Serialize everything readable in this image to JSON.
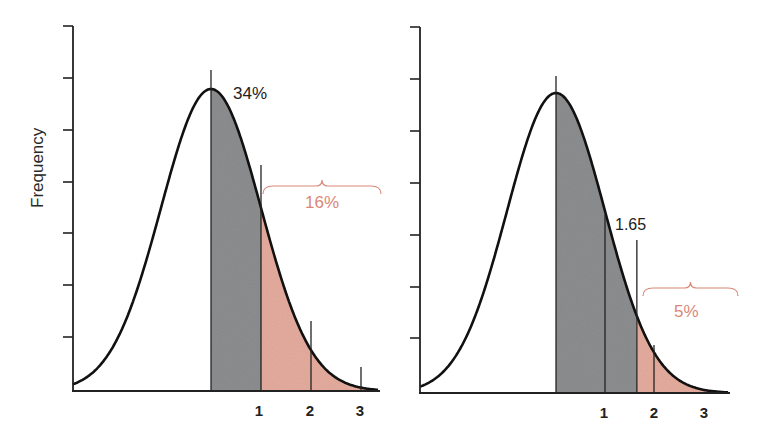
{
  "figure": {
    "y_axis_label": "Frequency",
    "colors": {
      "curve": "#111111",
      "axis": "#222222",
      "gray_fill": "#8e8f91",
      "tail_fill": "#e6ad9f",
      "annotation_red": "#d98878",
      "text_dark": "#222222"
    }
  },
  "chart_data": [
    {
      "type": "area",
      "title": "",
      "description": "Normal distribution (one-tailed, 1 SD): 34% between mean and +1 SD, 16% beyond +1 SD",
      "xlabel": "",
      "ylabel": "Frequency",
      "x_ticks": [
        "1",
        "2",
        "3"
      ],
      "y_ticks_count": 7,
      "y_tick_labels": [],
      "shaded_regions": [
        {
          "from": 0,
          "to": 1,
          "color": "gray",
          "label": "34%"
        },
        {
          "from": 1,
          "to": 3.5,
          "color": "red",
          "label": "16%"
        }
      ],
      "markers": [
        0,
        1,
        2,
        3
      ],
      "annotations": [
        {
          "text": "34%",
          "x": 0.3,
          "position": "near peak"
        },
        {
          "text": "16%",
          "x": 2.2,
          "position": "brace over upper tail",
          "color": "red"
        }
      ],
      "grid": false,
      "legend": null
    },
    {
      "type": "area",
      "title": "",
      "description": "Normal distribution with critical value 1.65: 5% of area beyond z = 1.65",
      "xlabel": "",
      "ylabel": "Frequency",
      "x_ticks": [
        "1",
        "2",
        "3"
      ],
      "y_ticks_count": 7,
      "y_tick_labels": [],
      "shaded_regions": [
        {
          "from": 0,
          "to": 1.65,
          "color": "gray",
          "label": ""
        },
        {
          "from": 1.65,
          "to": 3.5,
          "color": "red",
          "label": "5%"
        }
      ],
      "markers": [
        0,
        1,
        1.65,
        2
      ],
      "annotations": [
        {
          "text": "1.65",
          "x": 1.65,
          "position": "above cutoff line"
        },
        {
          "text": "5%",
          "x": 2.5,
          "position": "brace over upper tail",
          "color": "red"
        }
      ],
      "grid": false,
      "legend": null
    }
  ],
  "left_chart": {
    "label_34": "34%",
    "label_16": "16%",
    "ticks": [
      "1",
      "2",
      "3"
    ]
  },
  "right_chart": {
    "label_cutoff": "1.65",
    "label_5": "5%",
    "ticks": [
      "1",
      "2",
      "3"
    ]
  }
}
